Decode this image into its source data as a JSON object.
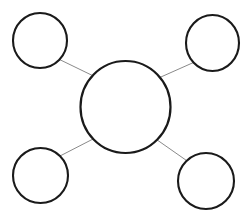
{
  "diagram": {
    "type": "node-link-diagram",
    "canvas": {
      "width": 250,
      "height": 221,
      "background": "#ffffff"
    },
    "style": {
      "node_stroke_color": "#1a1a1a",
      "node_fill_color": "#ffffff",
      "node_stroke_width": 2.1,
      "edge_stroke_color": "#8a8a8a",
      "edge_stroke_width": 1
    },
    "nodes": [
      {
        "id": "hub",
        "role": "central-node",
        "label": "",
        "cx": 125.5,
        "cy": 107,
        "r": 45,
        "rx": 45,
        "ry": 46
      },
      {
        "id": "satellite-top-left",
        "role": "satellite-node",
        "label": "",
        "cx": 40,
        "cy": 40.5,
        "r": 27,
        "rx": 27,
        "ry": 27.5
      },
      {
        "id": "satellite-top-right",
        "role": "satellite-node",
        "label": "",
        "cx": 212.5,
        "cy": 43,
        "r": 27,
        "rx": 26.5,
        "ry": 28
      },
      {
        "id": "satellite-bottom-left",
        "role": "satellite-node",
        "label": "",
        "cx": 40.5,
        "cy": 175.5,
        "r": 27,
        "rx": 27.5,
        "ry": 27.5
      },
      {
        "id": "satellite-bottom-right",
        "role": "satellite-node",
        "label": "",
        "cx": 206,
        "cy": 181,
        "r": 28,
        "rx": 28,
        "ry": 28
      }
    ],
    "edges": [
      {
        "id": "edge-hub-top-left",
        "from": "hub",
        "to": "satellite-top-left",
        "x1": 59.5,
        "y1": 59.5,
        "x2": 94.5,
        "y2": 76.5
      },
      {
        "id": "edge-hub-top-right",
        "from": "hub",
        "to": "satellite-top-right",
        "x1": 193.5,
        "y1": 62.5,
        "x2": 157.5,
        "y2": 78.5
      },
      {
        "id": "edge-hub-bottom-left",
        "from": "hub",
        "to": "satellite-bottom-left",
        "x1": 60.0,
        "y1": 156.0,
        "x2": 95.0,
        "y2": 138.0
      },
      {
        "id": "edge-hub-bottom-right",
        "from": "hub",
        "to": "satellite-bottom-right",
        "x1": 186.5,
        "y1": 160.5,
        "x2": 156.5,
        "y2": 139.5
      }
    ]
  }
}
